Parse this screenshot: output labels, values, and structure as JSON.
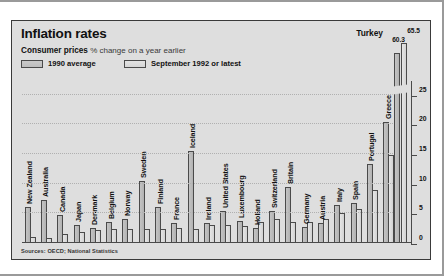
{
  "header": {
    "title": "Inflation rates",
    "subtitle_bold": "Consumer prices",
    "subtitle_rest": "% change on a year earlier"
  },
  "legend": {
    "series1_label": "1990 average",
    "series2_label": "September 1992 or latest",
    "position": "top-left"
  },
  "callout": {
    "country": "Turkey",
    "value_1992": "65.5",
    "value_1990": "60.3"
  },
  "source": "Sources: OECD; National Statistics",
  "axis": {
    "ticks": [
      "0",
      "5",
      "10",
      "15",
      "20",
      "25"
    ]
  },
  "colors": {
    "panel_bg": "#dedede",
    "bar_1990": "#b8b8b8",
    "bar_1992": "#dcdcdc",
    "outline": "#4a4a4a",
    "text": "#111111"
  },
  "chart_data": {
    "type": "bar",
    "title": "Inflation rates",
    "subtitle": "Consumer prices % change on a year earlier",
    "xlabel": "",
    "ylabel": "% change on a year earlier",
    "ylim": [
      0,
      27
    ],
    "yticks": [
      0,
      5,
      10,
      15,
      20,
      25
    ],
    "grid": true,
    "legend_position": "top-left",
    "note": "Turkey bars are broken/truncated; labelled 60.3 (1990) and 65.5 (1992)",
    "categories": [
      "New Zealand",
      "Australia",
      "Canada",
      "Japan",
      "Denmark",
      "Belgium",
      "Norway",
      "Sweden",
      "Finland",
      "France",
      "Iceland",
      "Ireland",
      "United States",
      "Luxembourg",
      "Holland",
      "Switzerland",
      "Britain",
      "Germany",
      "Austria",
      "Italy",
      "Spain",
      "Portugal",
      "Greece",
      "Turkey"
    ],
    "series": [
      {
        "name": "1990 average",
        "values": [
          6.1,
          7.3,
          4.8,
          3.1,
          2.6,
          3.5,
          4.1,
          10.4,
          6.1,
          3.4,
          15.5,
          3.3,
          5.4,
          3.7,
          2.5,
          5.4,
          9.5,
          2.7,
          3.3,
          6.4,
          6.7,
          13.4,
          20.4,
          60.3
        ]
      },
      {
        "name": "September 1992 or latest",
        "values": [
          1.0,
          0.8,
          1.5,
          1.9,
          2.2,
          2.4,
          2.3,
          2.4,
          2.4,
          2.5,
          2.4,
          3.0,
          3.0,
          2.9,
          3.5,
          4.0,
          3.6,
          3.5,
          4.0,
          5.0,
          5.7,
          9.0,
          14.9,
          65.5
        ]
      }
    ]
  }
}
